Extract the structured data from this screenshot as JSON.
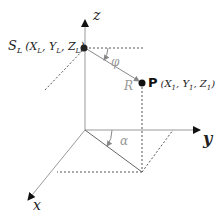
{
  "diagram": {
    "title": "",
    "axes": {
      "x": "x",
      "y": "y",
      "z": "z"
    },
    "points": {
      "source": {
        "label": "S",
        "subscript": "L",
        "coords": "(X",
        "full_label": "S_L (X_L, Y_L, Z_L)",
        "parts": [
          "S",
          "L",
          "(X",
          "L",
          ", Y",
          "L",
          ", Z",
          "L",
          ")"
        ]
      },
      "target": {
        "label": "P",
        "full_label": "P (X_1, Y_1, Z_1)",
        "parts": [
          "P",
          "(X",
          "1",
          ", Y",
          "1",
          ", Z",
          "1",
          ")"
        ]
      }
    },
    "vector_label": "R",
    "angles": {
      "elevation": "φ",
      "azimuth": "α"
    },
    "colors": {
      "axis": "#999999",
      "dotted": "#555555",
      "point": "#111111",
      "arrow": "#111111",
      "angle_label": "#999999"
    }
  }
}
